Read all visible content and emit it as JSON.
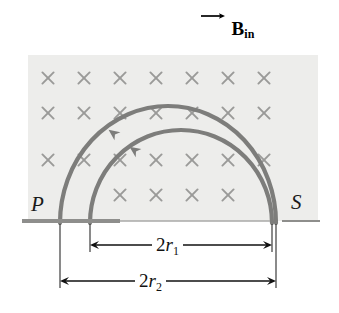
{
  "figure": {
    "name": "charged-particle-semicircular-paths-in-magnetic-field",
    "background_color": "#ffffff"
  },
  "field_region": {
    "name": "magnetic-field-region",
    "fill_color": "#ededeb",
    "x": 28,
    "y": 55,
    "width": 290,
    "height": 166,
    "marker_symbol": "×",
    "marker_color": "#9a9a98",
    "marker_label": "x-mark-into-page",
    "columns": 7,
    "rows": 4,
    "column_x": [
      48,
      84,
      120,
      156,
      192,
      228,
      264
    ],
    "row_y": [
      78,
      113,
      160,
      195
    ],
    "bottom_row_columns": [
      120,
      156,
      192,
      228
    ]
  },
  "field_label": {
    "name": "magnetic-field-label",
    "symbol": "B",
    "subscript": "in",
    "vector_arrow": "right-arrow-overline",
    "color": "#000000"
  },
  "baseline": {
    "name": "boundary-baseline",
    "y": 221,
    "thick_segment": {
      "x1": 22,
      "x2": 120,
      "color": "#8e8e8c",
      "width": 4
    },
    "thin_segment": {
      "x1": 120,
      "x2": 270,
      "color": "#a9a9a7",
      "width": 1.5
    },
    "tail_segment": {
      "x1": 282,
      "x2": 320,
      "color": "#8e8e8c",
      "width": 2
    }
  },
  "arcs": [
    {
      "name": "outer-trajectory-arc",
      "id": "arc-r2",
      "left_foot_x": 60,
      "right_foot_x": 276,
      "apex_y": 104,
      "color": "#7d7d7b",
      "stroke_width": 4.2,
      "arrowhead": {
        "x": 113,
        "y": 133,
        "label": "arrowhead-outer-arc",
        "direction": "counterclockwise"
      }
    },
    {
      "name": "inner-trajectory-arc",
      "id": "arc-r1",
      "left_foot_x": 90,
      "right_foot_x": 272,
      "apex_y": 128,
      "color": "#7d7d7b",
      "stroke_width": 4.2,
      "arrowhead": {
        "x": 134,
        "y": 150,
        "label": "arrowhead-inner-arc",
        "direction": "counterclockwise"
      }
    }
  ],
  "points": {
    "p": {
      "name": "point-p-label",
      "label": "P",
      "x": 31,
      "y": 192
    },
    "s": {
      "name": "point-s-label",
      "label": "S",
      "x": 291,
      "y": 190
    }
  },
  "dimensions": [
    {
      "name": "diameter-r1-dimension",
      "id": "dim-r1",
      "label_prefix": "2",
      "label_symbol": "r",
      "label_subscript": "1",
      "y": 245,
      "x1": 90,
      "x2": 272,
      "color": "#111111"
    },
    {
      "name": "diameter-r2-dimension",
      "id": "dim-r2",
      "label_prefix": "2",
      "label_symbol": "r",
      "label_subscript": "2",
      "y": 281,
      "x1": 60,
      "x2": 276,
      "color": "#111111"
    }
  ],
  "extension_lines": {
    "name": "dimension-extension-lines",
    "color": "#2a2a2a",
    "lines": [
      {
        "x": 60,
        "y1": 224,
        "y2": 288
      },
      {
        "x": 90,
        "y1": 224,
        "y2": 252
      },
      {
        "x": 272,
        "y1": 224,
        "y2": 252
      },
      {
        "x": 276,
        "y1": 224,
        "y2": 288
      }
    ]
  }
}
